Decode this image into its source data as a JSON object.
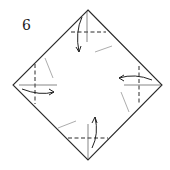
{
  "diagram": {
    "step_number": "6",
    "shape": "square-diamond",
    "colors": {
      "line": "#2a2a2a",
      "background": "#ffffff"
    },
    "folds": [
      {
        "corner": "top",
        "type": "valley-fold",
        "arrow_direction": "down"
      },
      {
        "corner": "right",
        "type": "valley-fold",
        "arrow_direction": "left"
      },
      {
        "corner": "bottom",
        "type": "valley-fold",
        "arrow_direction": "up"
      },
      {
        "corner": "left",
        "type": "valley-fold",
        "arrow_direction": "right"
      }
    ]
  }
}
